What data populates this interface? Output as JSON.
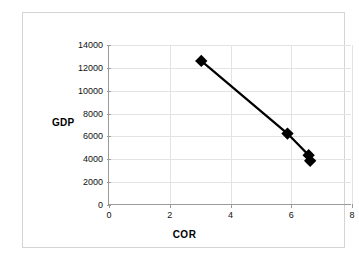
{
  "chart_data": {
    "type": "line",
    "title": "",
    "xlabel": "COR",
    "ylabel": "GDP",
    "xlim": [
      0,
      8
    ],
    "ylim": [
      0,
      14000
    ],
    "xticks": [
      0,
      2,
      4,
      6,
      8
    ],
    "xtick_labels": [
      "0",
      "2",
      "4",
      "6",
      "8"
    ],
    "yticks": [
      0,
      2000,
      4000,
      6000,
      8000,
      10000,
      12000,
      14000
    ],
    "ytick_labels": [
      "0",
      "2000",
      "4000",
      "6000",
      "8000",
      "10000",
      "12000",
      "14000"
    ],
    "grid": true,
    "legend": "none",
    "marker": "diamond",
    "marker_color": "#000000",
    "line_color": "#000000",
    "series": [
      {
        "name": "GDP vs COR",
        "points": [
          {
            "x": 3.05,
            "y": 12600
          },
          {
            "x": 5.9,
            "y": 6200
          },
          {
            "x": 6.6,
            "y": 4300
          },
          {
            "x": 6.65,
            "y": 3800
          }
        ]
      }
    ]
  },
  "figure": {
    "border_color": "#d4d4d4",
    "axis_color": "#9a9a9a",
    "gridline_color": "#e3e3e3",
    "background": "#ffffff"
  }
}
